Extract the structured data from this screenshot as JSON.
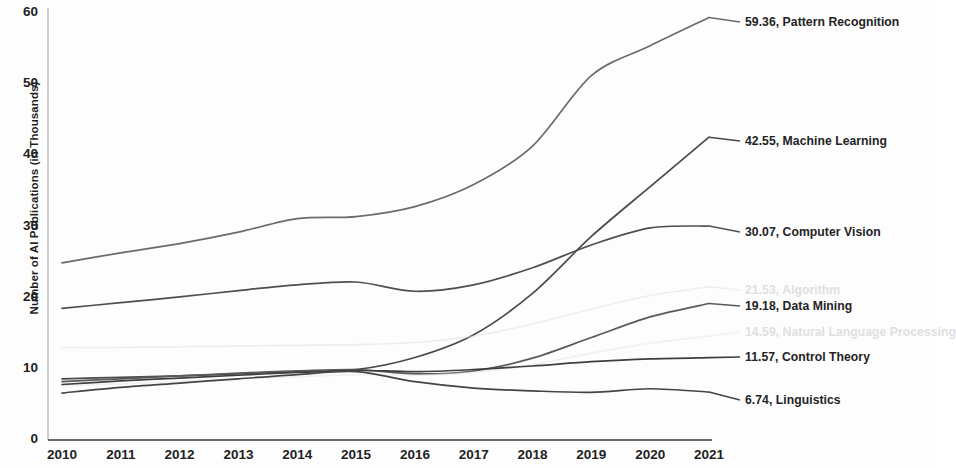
{
  "chart_data": {
    "type": "line",
    "title": "",
    "xlabel": "",
    "ylabel": "Number of AI Publications (in Thousands)",
    "x": [
      2010,
      2011,
      2012,
      2013,
      2014,
      2015,
      2016,
      2017,
      2018,
      2019,
      2020,
      2021
    ],
    "xticklabels": [
      "2010",
      "2011",
      "2012",
      "2013",
      "2014",
      "2015",
      "2016",
      "2017",
      "2018",
      "2019",
      "2020",
      "2021"
    ],
    "yticklabels": [
      "0",
      "10",
      "20",
      "30",
      "40",
      "50",
      "60"
    ],
    "yticks": [
      0,
      10,
      20,
      30,
      40,
      50,
      60
    ],
    "ylim": [
      0,
      62
    ],
    "xlim": [
      2010,
      2021
    ],
    "grid": false,
    "legend_position": "right-end-labels",
    "series": [
      {
        "name": "Pattern Recognition",
        "end_value": "59.36",
        "label": "59.36, Pattern Recognition",
        "color": "#6b6b6b",
        "opacity": 1,
        "values": [
          24.9,
          26.3,
          27.6,
          29.2,
          31.1,
          31.4,
          32.8,
          35.9,
          41.3,
          51.2,
          55.4,
          59.36
        ]
      },
      {
        "name": "Machine Learning",
        "end_value": "42.55",
        "label": "42.55, Machine Learning",
        "color": "#4a4a4a",
        "opacity": 1,
        "values": [
          8.6,
          8.8,
          9.0,
          9.3,
          9.6,
          9.9,
          11.6,
          14.8,
          20.6,
          28.6,
          35.6,
          42.55
        ]
      },
      {
        "name": "Computer Vision",
        "end_value": "30.07",
        "label": "30.07, Computer Vision",
        "color": "#4f4f4f",
        "opacity": 1,
        "values": [
          18.5,
          19.3,
          20.1,
          21.0,
          21.8,
          22.2,
          20.9,
          21.8,
          24.2,
          27.4,
          29.8,
          30.07
        ]
      },
      {
        "name": "Algorithm",
        "end_value": "21.53",
        "label": "21.53, Algorithm",
        "color": "#dcdcdc",
        "opacity": 0.45,
        "values": [
          13.0,
          13.0,
          13.1,
          13.2,
          13.3,
          13.4,
          13.7,
          14.6,
          16.3,
          18.4,
          20.3,
          21.53
        ]
      },
      {
        "name": "Data Mining",
        "end_value": "19.18",
        "label": "19.18, Data Mining",
        "color": "#5a5a5a",
        "opacity": 1,
        "values": [
          8.2,
          8.6,
          9.0,
          9.4,
          9.7,
          9.9,
          9.3,
          9.7,
          11.5,
          14.4,
          17.3,
          19.18
        ]
      },
      {
        "name": "Natural Language Processing",
        "end_value": "14.59",
        "label": "14.59, Natural Language Processing",
        "color": "#e2e2e2",
        "opacity": 0.45,
        "values": [
          7.6,
          7.9,
          8.2,
          8.6,
          8.9,
          9.2,
          9.1,
          9.5,
          10.6,
          12.2,
          13.6,
          14.59
        ]
      },
      {
        "name": "Control Theory",
        "end_value": "11.57",
        "label": "11.57, Control Theory",
        "color": "#3f3f3f",
        "opacity": 1,
        "values": [
          7.8,
          8.3,
          8.7,
          9.1,
          9.5,
          9.8,
          9.6,
          9.9,
          10.4,
          11.0,
          11.4,
          11.57
        ]
      },
      {
        "name": "Linguistics",
        "end_value": "6.74",
        "label": "6.74, Linguistics",
        "color": "#454545",
        "opacity": 1,
        "values": [
          6.6,
          7.4,
          8.0,
          8.6,
          9.2,
          9.6,
          8.2,
          7.3,
          6.9,
          6.7,
          7.2,
          6.74
        ]
      }
    ],
    "labels_right": [
      {
        "text": "59.36, Pattern Recognition",
        "y": 22,
        "style": "normal"
      },
      {
        "text": "42.55, Machine Learning",
        "y": 141,
        "style": "normal"
      },
      {
        "text": "30.07, Computer Vision",
        "y": 232,
        "style": "normal"
      },
      {
        "text": "21.53, Algorithm",
        "y": 290,
        "style": "faded"
      },
      {
        "text": "19.18, Data Mining",
        "y": 306,
        "style": "normal"
      },
      {
        "text": "14.59, Natural Language Processing",
        "y": 332,
        "style": "faded"
      },
      {
        "text": "11.57, Control Theory",
        "y": 357,
        "style": "normal"
      },
      {
        "text": "6.74, Linguistics",
        "y": 400,
        "style": "normal"
      }
    ]
  }
}
